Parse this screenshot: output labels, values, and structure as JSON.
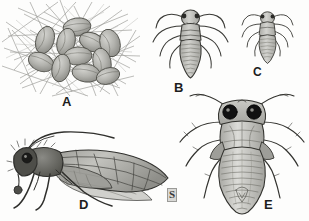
{
  "plate": {
    "title": "Psocid (booklouse) life stages illustration plate",
    "medium": "grayscale pen-and-ink scientific illustration",
    "background_color": "#fdfdfc",
    "ink_color": "#303030",
    "fill_gray": "#b9b9b4",
    "eye_color": "#111111",
    "width": 309,
    "height": 221
  },
  "signature": {
    "mark": "S",
    "name": "artist-signature"
  },
  "figures": [
    {
      "id": "A",
      "label": "A",
      "name": "egg-cluster-in-silk-web",
      "description": "Cluster of eleven oval eggs covered by a loose mesh of radiating silk threads",
      "egg_count": 11,
      "eggs": [
        {
          "cx": 77,
          "cy": 27,
          "rx": 14,
          "ry": 9,
          "angle": -8
        },
        {
          "cx": 45,
          "cy": 40,
          "rx": 9,
          "ry": 14,
          "angle": 18
        },
        {
          "cx": 66,
          "cy": 42,
          "rx": 9,
          "ry": 14,
          "angle": 14
        },
        {
          "cx": 92,
          "cy": 42,
          "rx": 13,
          "ry": 9,
          "angle": 24
        },
        {
          "cx": 110,
          "cy": 43,
          "rx": 10,
          "ry": 14,
          "angle": -16
        },
        {
          "cx": 78,
          "cy": 56,
          "rx": 14,
          "ry": 9,
          "angle": -4
        },
        {
          "cx": 41,
          "cy": 62,
          "rx": 13,
          "ry": 9,
          "angle": 22
        },
        {
          "cx": 61,
          "cy": 68,
          "rx": 9,
          "ry": 14,
          "angle": 12
        },
        {
          "cx": 102,
          "cy": 62,
          "rx": 9,
          "ry": 14,
          "angle": -12
        },
        {
          "cx": 86,
          "cy": 73,
          "rx": 14,
          "ry": 9,
          "angle": 8
        },
        {
          "cx": 108,
          "cy": 76,
          "rx": 12,
          "ry": 8,
          "angle": -18
        }
      ]
    },
    {
      "id": "B",
      "label": "B",
      "name": "nymph-dorsal-large",
      "description": "Dorsal view of a larger nymph with long outward-curving antennae, three pairs of legs and a segmented teardrop abdomen",
      "abdomen_segments": 8
    },
    {
      "id": "C",
      "label": "C",
      "name": "nymph-dorsal-small",
      "description": "Dorsal view of a smaller earlier-instar nymph, same form as B at reduced scale",
      "abdomen_segments": 7
    },
    {
      "id": "D",
      "label": "D",
      "name": "winged-adult-lateral",
      "description": "Lateral view of winged adult psocid with bristly head, large dark eye, long antenna arched over the body and a veined forewing showing closed cells",
      "wings": 1,
      "legs": 3
    },
    {
      "id": "E",
      "label": "E",
      "name": "adult-dorsal-large",
      "description": "Large dorsal view with two prominent black compound eyes, spread legs and a banded teardrop abdomen",
      "abdomen_segments": 10,
      "eyes": 2
    }
  ]
}
